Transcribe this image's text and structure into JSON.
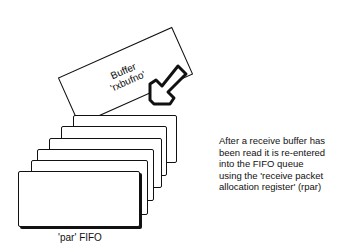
{
  "buffer": {
    "line1": "Buffer",
    "line2": "'rxbufno'"
  },
  "fifo": {
    "label": "'par' FIFO",
    "card_count": 6
  },
  "note": {
    "lines": [
      "After a receive buffer has",
      "been read it is re-entered",
      "into the FIFO queue",
      "using the 'receive packet",
      "allocation register' (rpar)"
    ]
  },
  "icons": {
    "arrow": "arrow-down-left-icon"
  }
}
